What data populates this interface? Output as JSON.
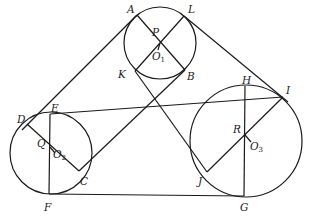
{
  "diagram": {
    "type": "geometry-three-circles-with-tangents",
    "circles": [
      {
        "name": "O1",
        "cx": 160,
        "cy": 43,
        "r": 36,
        "label": "O",
        "sub": "1",
        "label_x": 152,
        "label_y": 60
      },
      {
        "name": "O2",
        "cx": 51,
        "cy": 153,
        "r": 41,
        "label": "O",
        "sub": "2",
        "label_x": 53,
        "label_y": 158
      },
      {
        "name": "O3",
        "cx": 246,
        "cy": 141,
        "r": 56,
        "label": "O",
        "sub": "3",
        "label_x": 250,
        "label_y": 150
      }
    ],
    "points": [
      {
        "id": "A",
        "x": 137,
        "y": 15,
        "lx": 127,
        "ly": 13
      },
      {
        "id": "L",
        "x": 184,
        "y": 16,
        "lx": 188,
        "ly": 13
      },
      {
        "id": "P",
        "x": 160,
        "y": 43,
        "lx": 152,
        "ly": 36
      },
      {
        "id": "K",
        "x": 135,
        "y": 71,
        "lx": 118,
        "ly": 78
      },
      {
        "id": "B",
        "x": 185,
        "y": 70,
        "lx": 187,
        "ly": 80
      },
      {
        "id": "D",
        "x": 27,
        "y": 124,
        "lx": 17,
        "ly": 123
      },
      {
        "id": "E",
        "x": 50,
        "y": 114,
        "lx": 51,
        "ly": 112
      },
      {
        "id": "Q",
        "x": 50,
        "y": 147,
        "lx": 37,
        "ly": 147
      },
      {
        "id": "F",
        "x": 49,
        "y": 194,
        "lx": 44,
        "ly": 211
      },
      {
        "id": "C",
        "x": 79,
        "y": 171,
        "lx": 80,
        "ly": 185
      },
      {
        "id": "H",
        "x": 245,
        "y": 86,
        "lx": 242,
        "ly": 84
      },
      {
        "id": "I",
        "x": 282,
        "y": 98,
        "lx": 286,
        "ly": 94
      },
      {
        "id": "R",
        "x": 245,
        "y": 135,
        "lx": 233,
        "ly": 133
      },
      {
        "id": "J",
        "x": 207,
        "y": 172,
        "lx": 198,
        "ly": 185
      },
      {
        "id": "G",
        "x": 244,
        "y": 196,
        "lx": 240,
        "ly": 211
      }
    ],
    "segments": [
      {
        "name": "tangent-A-D",
        "x1": 137,
        "y1": 15,
        "x2": 22,
        "y2": 130
      },
      {
        "name": "tangent-L-I",
        "x1": 184,
        "y1": 16,
        "x2": 288,
        "y2": 102
      },
      {
        "name": "tangent-E-H",
        "x1": 50,
        "y1": 114,
        "x2": 283,
        "y2": 97
      },
      {
        "name": "tangent-F-G",
        "x1": 49,
        "y1": 194,
        "x2": 244,
        "y2": 196
      },
      {
        "name": "line-K-J",
        "x1": 135,
        "y1": 71,
        "x2": 207,
        "y2": 172
      },
      {
        "name": "line-B-C",
        "x1": 185,
        "y1": 70,
        "x2": 79,
        "y2": 171
      },
      {
        "name": "diameter-A-B",
        "x1": 137,
        "y1": 15,
        "x2": 185,
        "y2": 70
      },
      {
        "name": "diameter-L-K",
        "x1": 184,
        "y1": 16,
        "x2": 135,
        "y2": 71
      },
      {
        "name": "chord-D-C",
        "x1": 27,
        "y1": 124,
        "x2": 79,
        "y2": 171
      },
      {
        "name": "chord-E-F",
        "x1": 50,
        "y1": 114,
        "x2": 49,
        "y2": 194
      },
      {
        "name": "chord-H-G",
        "x1": 245,
        "y1": 86,
        "x2": 244,
        "y2": 196
      },
      {
        "name": "chord-I-J",
        "x1": 282,
        "y1": 98,
        "x2": 207,
        "y2": 172
      },
      {
        "name": "tick-O1",
        "x1": 160,
        "y1": 43,
        "x2": 158,
        "y2": 50
      },
      {
        "name": "tick-O2",
        "x1": 50,
        "y1": 147,
        "x2": 55,
        "y2": 153
      },
      {
        "name": "tick-O3",
        "x1": 245,
        "y1": 135,
        "x2": 251,
        "y2": 142
      }
    ]
  }
}
